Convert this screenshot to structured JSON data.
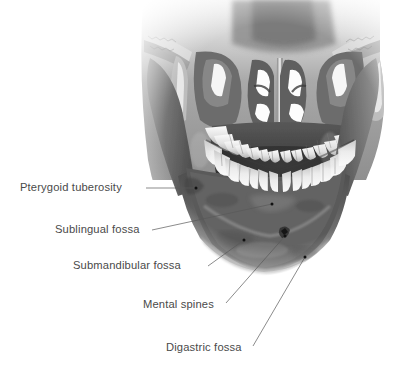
{
  "figure": {
    "view": "internal posterior view",
    "background_color": "#ffffff",
    "label_color": "#4a4a4a",
    "leader_color": "#595959",
    "dot_color": "#111111"
  },
  "labels": [
    {
      "id": "pterygoid-tuberosity",
      "text": "Pterygoid tuberosity",
      "text_x": 20,
      "text_y": 188,
      "anchor_x": 146,
      "anchor_y": 188,
      "dot_x": 196,
      "dot_y": 188,
      "line": "M146,188 L196,188"
    },
    {
      "id": "sublingual-fossa",
      "text": "Sublingual fossa",
      "text_x": 55,
      "text_y": 230,
      "anchor_x": 152,
      "anchor_y": 230,
      "dot_x": 272,
      "dot_y": 204,
      "line": "M152,230 L272,204"
    },
    {
      "id": "submandibular-fossa",
      "text": "Submandibular fossa",
      "text_x": 73,
      "text_y": 266,
      "anchor_x": 208,
      "anchor_y": 266,
      "dot_x": 244,
      "dot_y": 240,
      "line": "M208,266 L244,240"
    },
    {
      "id": "mental-spines",
      "text": "Mental spines",
      "text_x": 143,
      "text_y": 305,
      "anchor_x": 226,
      "anchor_y": 303,
      "dot_x": 285,
      "dot_y": 236,
      "line": "M226,303 L285,236"
    },
    {
      "id": "digastric-fossa",
      "text": "Digastric fossa",
      "text_x": 166,
      "text_y": 348,
      "anchor_x": 253,
      "anchor_y": 346,
      "dot_x": 305,
      "dot_y": 257,
      "line": "M253,346 L305,257"
    }
  ]
}
